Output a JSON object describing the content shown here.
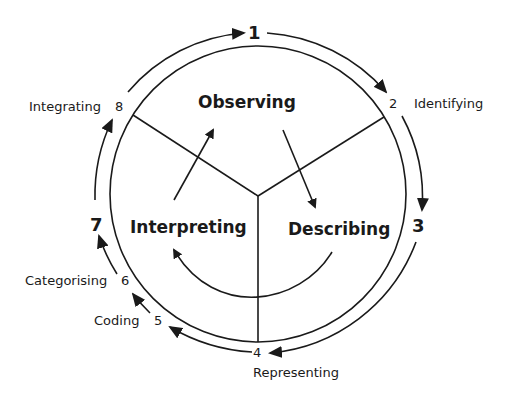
{
  "diagram": {
    "type": "cyclical process diagram",
    "phases": [
      {
        "id": "observing",
        "label": "Observing"
      },
      {
        "id": "describing",
        "label": "Describing"
      },
      {
        "id": "interpreting",
        "label": "Interpreting"
      }
    ],
    "steps": [
      {
        "number": "1",
        "label": ""
      },
      {
        "number": "2",
        "label": "Identifying"
      },
      {
        "number": "3",
        "label": ""
      },
      {
        "number": "4",
        "label": "Representing"
      },
      {
        "number": "5",
        "label": "Coding"
      },
      {
        "number": "6",
        "label": "Categorising"
      },
      {
        "number": "7",
        "label": ""
      },
      {
        "number": "8",
        "label": "Integrating"
      }
    ],
    "colors": {
      "stroke": "#1a1a1a",
      "background": "#ffffff"
    }
  }
}
